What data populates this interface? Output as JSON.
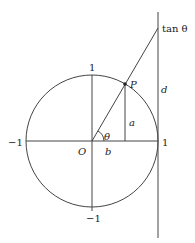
{
  "diagram": {
    "colors": {
      "stroke": "#444444",
      "text": "#222222",
      "background": "#ffffff"
    },
    "labels": {
      "tan": "tan θ",
      "top_one": "1",
      "right_one": "1",
      "left_minus_one": "−1",
      "bottom_minus_one": "−1",
      "origin": "O",
      "point": "P",
      "angle": "θ",
      "opposite": "a",
      "adjacent": "b",
      "tangent_segment": "d"
    }
  }
}
